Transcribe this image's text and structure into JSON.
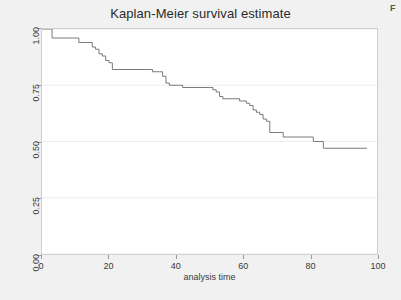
{
  "figure": {
    "corner_mark": "F",
    "background_color": "#f1f1f1",
    "plot_background_color": "#ffffff"
  },
  "chart_data": {
    "type": "line",
    "step": "post",
    "title": "Kaplan-Meier survival estimate",
    "subtitle": "",
    "xlabel": "analysis time",
    "ylabel": "",
    "xlim": [
      0,
      100
    ],
    "ylim": [
      0,
      1
    ],
    "xticks": [
      0,
      20,
      40,
      60,
      80,
      100
    ],
    "xtick_labels": [
      "0",
      "20",
      "40",
      "60",
      "80",
      "100"
    ],
    "yticks": [
      0.0,
      0.25,
      0.5,
      0.75,
      1.0
    ],
    "ytick_labels": [
      "0.00",
      "0.25",
      "0.50",
      "0.75",
      "1.00"
    ],
    "grid": "horizontal",
    "legend": "none",
    "line_color": "#7a7a7a",
    "line_width": 1,
    "series": [
      {
        "name": "Survivor function",
        "x": [
          0,
          2,
          3,
          9,
          11,
          13,
          15,
          16,
          17,
          18,
          19,
          20,
          21,
          32,
          33,
          35,
          36,
          37,
          38,
          41,
          42,
          50,
          51,
          52,
          53,
          54,
          57,
          59,
          61,
          62,
          63,
          64,
          65,
          66,
          67,
          68,
          71,
          72,
          80,
          81,
          83,
          84,
          97
        ],
        "y": [
          1.0,
          1.0,
          0.96,
          0.96,
          0.94,
          0.94,
          0.92,
          0.91,
          0.89,
          0.88,
          0.86,
          0.85,
          0.82,
          0.82,
          0.81,
          0.81,
          0.79,
          0.76,
          0.75,
          0.75,
          0.74,
          0.74,
          0.73,
          0.72,
          0.7,
          0.69,
          0.69,
          0.68,
          0.67,
          0.66,
          0.64,
          0.63,
          0.62,
          0.6,
          0.59,
          0.54,
          0.54,
          0.52,
          0.52,
          0.5,
          0.5,
          0.47,
          0.47
        ]
      }
    ]
  }
}
